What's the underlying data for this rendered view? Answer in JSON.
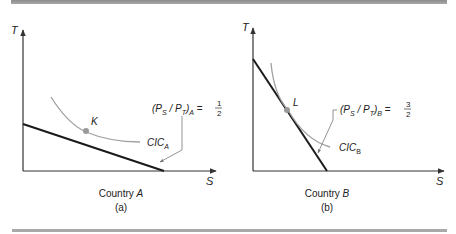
{
  "panels": [
    {
      "id": "a",
      "y_axis_label": "T",
      "x_axis_label": "S",
      "point_label": "K",
      "curve_label_main": "CIC",
      "curve_label_sub": "A",
      "price_ratio": {
        "prefix": "(P",
        "s_sub": "S",
        "mid": " / P",
        "t_sub": "T",
        "suffix": ")",
        "country_sub": "A",
        "equals": " = ",
        "numerator": "1",
        "denominator": "2"
      },
      "country_prefix": "Country ",
      "country_name": "A",
      "caption": "(a)"
    },
    {
      "id": "b",
      "y_axis_label": "T",
      "x_axis_label": "S",
      "point_label": "L",
      "curve_label_main": "CIC",
      "curve_label_sub": "B",
      "price_ratio": {
        "prefix": "(P",
        "s_sub": "S",
        "mid": " / P",
        "t_sub": "T",
        "suffix": ")",
        "country_sub": "B",
        "equals": " = ",
        "numerator": "3",
        "denominator": "2"
      },
      "country_prefix": "Country ",
      "country_name": "B",
      "caption": "(b)"
    }
  ],
  "colors": {
    "axis": "#333333",
    "budget_line": "#1a1a1a",
    "curve": "#a0a0a0",
    "point": "#999999",
    "pointer": "#777777"
  }
}
